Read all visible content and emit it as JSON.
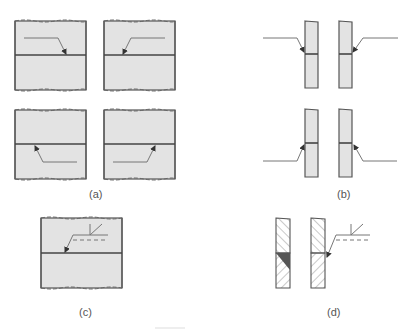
{
  "figure": {
    "labels": {
      "a": "(a)",
      "b": "(b)",
      "c": "(c)",
      "d": "(d)"
    },
    "colors": {
      "plate_fill": "#e3e3e3",
      "outline": "#555555",
      "leader": "#777777",
      "weld_fill": "#555555",
      "label": "#555555"
    },
    "panels": [
      {
        "id": "a",
        "description": "Four butt-joined plates in plan view, arrow leader lines pointing to joint from each quadrant"
      },
      {
        "id": "b",
        "description": "Four edge views of butt-joined plates with arrow leaders pointing to joint from each side"
      },
      {
        "id": "c",
        "description": "Plan view of butt joint with reference line, dashed line and fillet weld symbol"
      },
      {
        "id": "d",
        "description": "Cross-section hatched plates with fillet weld shown dark, and corresponding weld symbol"
      }
    ]
  }
}
